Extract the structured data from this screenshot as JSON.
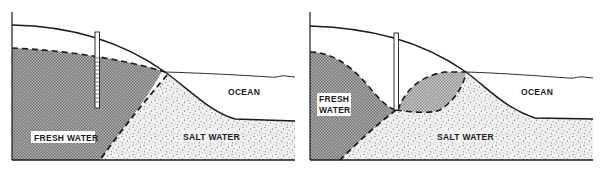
{
  "figure": {
    "panels": [
      {
        "id": "before-pumping",
        "labels": {
          "fresh_water": "FRESH WATER",
          "salt_water": "SALT WATER",
          "ocean": "OCEAN"
        }
      },
      {
        "id": "after-pumping",
        "labels": {
          "fresh_water_line1": "FRESH",
          "fresh_water_line2": "WATER",
          "salt_water": "SALT WATER",
          "ocean": "OCEAN"
        }
      }
    ],
    "colors": {
      "line": "#1a1a1a",
      "fresh_water_fill": "#9a9a9a",
      "salt_water_fill": "#e6e6e6",
      "background": "#ffffff"
    }
  }
}
